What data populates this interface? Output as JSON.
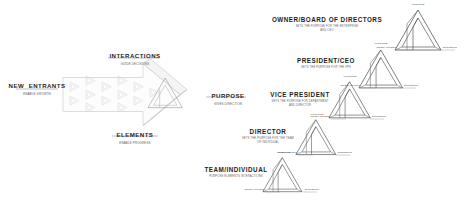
{
  "meta": {
    "diagram_title": "Purpose-Elements-Interactions organizational cascade",
    "background": "#ffffff",
    "stroke": "#4a4a4a",
    "light_stroke": "#c9c9c9",
    "text": "#1f1f1f",
    "subtext": "#5a5a5a"
  },
  "flow": {
    "entrants": {
      "line1": "NEW",
      "line2": "ENTRANTS",
      "sub": "ENABLE GROWTH"
    },
    "interactions": {
      "title": "INTERACTIONS",
      "sub": "GUIDE DECISIONS"
    },
    "elements": {
      "title": "ELEMENTS",
      "sub": "ENABLE PROGRESS"
    },
    "purpose": {
      "title": "PURPOSE",
      "sub": "GIVES DIRECTION"
    }
  },
  "vertex_labels": {
    "top": "PURPOSE",
    "left": "INTERACTIONS",
    "right": "ELEMENTS"
  },
  "hierarchy": [
    {
      "id": "owner-board",
      "title": "OWNER/BOARD OF DIRECTORS",
      "sub1": "SETS THE PURPOSE FOR THE ENTERPRISE",
      "sub2": "AND CEO"
    },
    {
      "id": "president-ceo",
      "title": "PRESIDENT/CEO",
      "sub1": "SETS THE PURPOSE FOR THE VPS",
      "sub2": ""
    },
    {
      "id": "vice-president",
      "title": "VICE PRESIDENT",
      "sub1": "SETS THE PURPOSE FOR DEPARTMENT",
      "sub2": "AND DIRECTOR"
    },
    {
      "id": "director",
      "title": "DIRECTOR",
      "sub1": "SETS THE PURPOSE FOR THE TEAM",
      "sub2": "OR INDIVIDUAL"
    },
    {
      "id": "team-individual",
      "title": "TEAM/INDIVIDUAL",
      "sub1": "PURPOSE ELEMENTS INTERACTIONS",
      "sub2": ""
    }
  ]
}
